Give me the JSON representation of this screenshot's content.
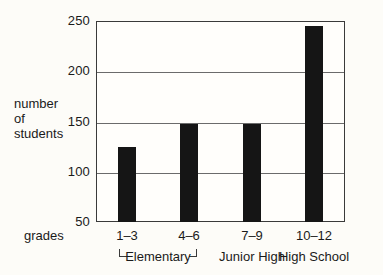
{
  "chart_data": {
    "type": "bar",
    "title": "",
    "xlabel": "grades",
    "ylabel": "number of students",
    "ylabel_lines": [
      "number",
      "of",
      "students"
    ],
    "categories": [
      "1–3",
      "4–6",
      "7–9",
      "10–12"
    ],
    "values": [
      125,
      148,
      148,
      245
    ],
    "ylim": [
      50,
      250
    ],
    "yticks": [
      50,
      100,
      150,
      200,
      250
    ],
    "ytick_labels": [
      "50",
      "100",
      "150",
      "200",
      "250"
    ],
    "grid": true,
    "grid_axis": "y",
    "legend": "none",
    "groups": [
      {
        "label": "Elementary",
        "categories": [
          "1–3",
          "4–6"
        ],
        "bracket": true
      },
      {
        "label": "Junior High",
        "categories": [
          "7–9"
        ],
        "bracket": false
      },
      {
        "label": "High School",
        "categories": [
          "10–12"
        ],
        "bracket": false
      }
    ],
    "bar_color": "#151515",
    "axis_color": "#3a3a3a",
    "background": "#fdfcf8"
  }
}
